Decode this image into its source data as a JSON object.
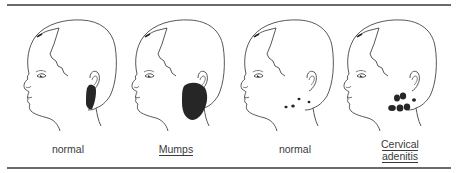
{
  "figure": {
    "panels": [
      {
        "id": "normal-parotid",
        "label": "normal",
        "underlined": false,
        "finding": "parotid-region"
      },
      {
        "id": "mumps",
        "label": "Mumps",
        "underlined": true,
        "finding": "enlarged-parotid"
      },
      {
        "id": "normal-nodes",
        "label": "normal",
        "underlined": false,
        "finding": "small-cervical-nodes"
      },
      {
        "id": "cervical-adenitis",
        "label_line1": "Cervical",
        "label_line2": "adenitis",
        "underlined": true,
        "finding": "enlarged-cervical-nodes"
      }
    ],
    "colors": {
      "ink": "#3a3a3a",
      "fill": "#262626",
      "rule": "#6a6a6a"
    }
  }
}
